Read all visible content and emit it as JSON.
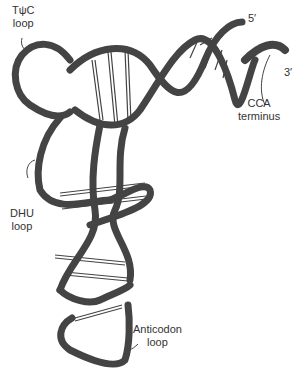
{
  "labels": {
    "tpsic_loop": [
      "TψC",
      "loop"
    ],
    "five_prime": "5′",
    "three_prime": "3′",
    "cca_terminus": [
      "CCA",
      "terminus"
    ],
    "dhu_loop": [
      "DHU",
      "loop"
    ],
    "anticodon_loop": [
      "Anticodon",
      "loop"
    ]
  },
  "colors": {
    "tpsic_loop": "#5a5a5a",
    "cca_terminus": "#1a1a1a",
    "dhu_loop": "#cfcfcf",
    "anticodon_loop": "#9a9a9a",
    "backbone": "#ffffff",
    "outline": "#444444"
  }
}
